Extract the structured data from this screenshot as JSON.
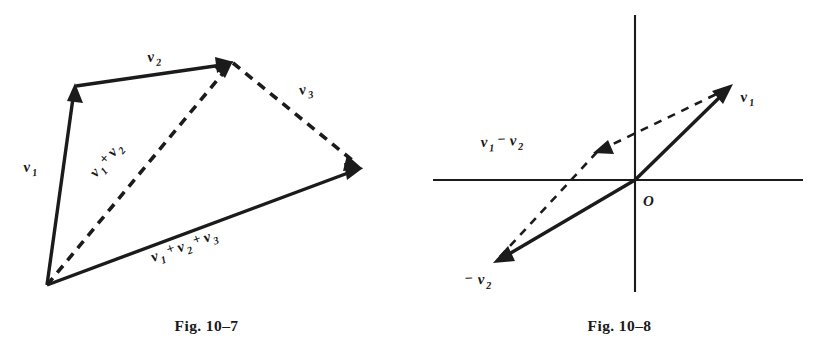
{
  "page": {
    "background": "#ffffff",
    "ink": "#1b1b1b",
    "width": 826,
    "height": 347
  },
  "figures": [
    {
      "id": "fig-10-7",
      "caption": "Fig. 10–7",
      "description": "Polygon method of adding three vectors tip to tail",
      "labels": {
        "v1": {
          "base": "v",
          "sub": "1"
        },
        "v2": {
          "base": "v",
          "sub": "2"
        },
        "v3": {
          "base": "v",
          "sub": "3"
        },
        "sum_v1_v2": [
          {
            "base": "v",
            "sub": "1"
          },
          {
            "op": "+"
          },
          {
            "base": "v",
            "sub": "2"
          }
        ],
        "sum_v1_v2_v3": [
          {
            "base": "v",
            "sub": "1"
          },
          {
            "op": "+"
          },
          {
            "base": "v",
            "sub": "2"
          },
          {
            "op": "+"
          },
          {
            "base": "v",
            "sub": "3"
          }
        ]
      },
      "vectors": [
        {
          "name": "v1",
          "style": "solid",
          "from": [
            47,
            285
          ],
          "to": [
            75,
            85
          ]
        },
        {
          "name": "v2",
          "style": "solid",
          "from": [
            75,
            85
          ],
          "to": [
            232,
            62
          ]
        },
        {
          "name": "v1+v2",
          "style": "dashed",
          "from": [
            47,
            285
          ],
          "to": [
            232,
            62
          ]
        },
        {
          "name": "v3",
          "style": "dashed",
          "from": [
            232,
            62
          ],
          "to": [
            362,
            168
          ]
        },
        {
          "name": "v1+v2+v3",
          "style": "solid",
          "from": [
            47,
            285
          ],
          "to": [
            362,
            168
          ]
        }
      ]
    },
    {
      "id": "fig-10-8",
      "caption": "Fig. 10–8",
      "description": "Vector subtraction shown on a set of coordinate axes",
      "origin_label": "O",
      "labels": {
        "v1": {
          "base": "v",
          "sub": "1"
        },
        "neg_v2": [
          {
            "op": "−"
          },
          {
            "base": "v",
            "sub": "2"
          }
        ],
        "v1_minus_v2": [
          {
            "base": "v",
            "sub": "1"
          },
          {
            "op": "−"
          },
          {
            "base": "v",
            "sub": "2"
          }
        ]
      },
      "axes": {
        "x": {
          "from": [
            20,
            180
          ],
          "to": [
            390,
            180
          ]
        },
        "y": {
          "from": [
            222,
            15
          ],
          "to": [
            222,
            292
          ]
        }
      },
      "vectors": [
        {
          "name": "v1",
          "style": "solid",
          "from": [
            222,
            180
          ],
          "to": [
            318,
            86
          ]
        },
        {
          "name": "-v2",
          "style": "solid",
          "from": [
            222,
            180
          ],
          "to": [
            82,
            262
          ]
        },
        {
          "name": "v1-v2",
          "style": "dashed",
          "from": [
            318,
            86
          ],
          "to": [
            182,
            152
          ]
        },
        {
          "name": "helper",
          "style": "dashed",
          "from": [
            182,
            152
          ],
          "to": [
            82,
            262
          ]
        }
      ]
    }
  ]
}
